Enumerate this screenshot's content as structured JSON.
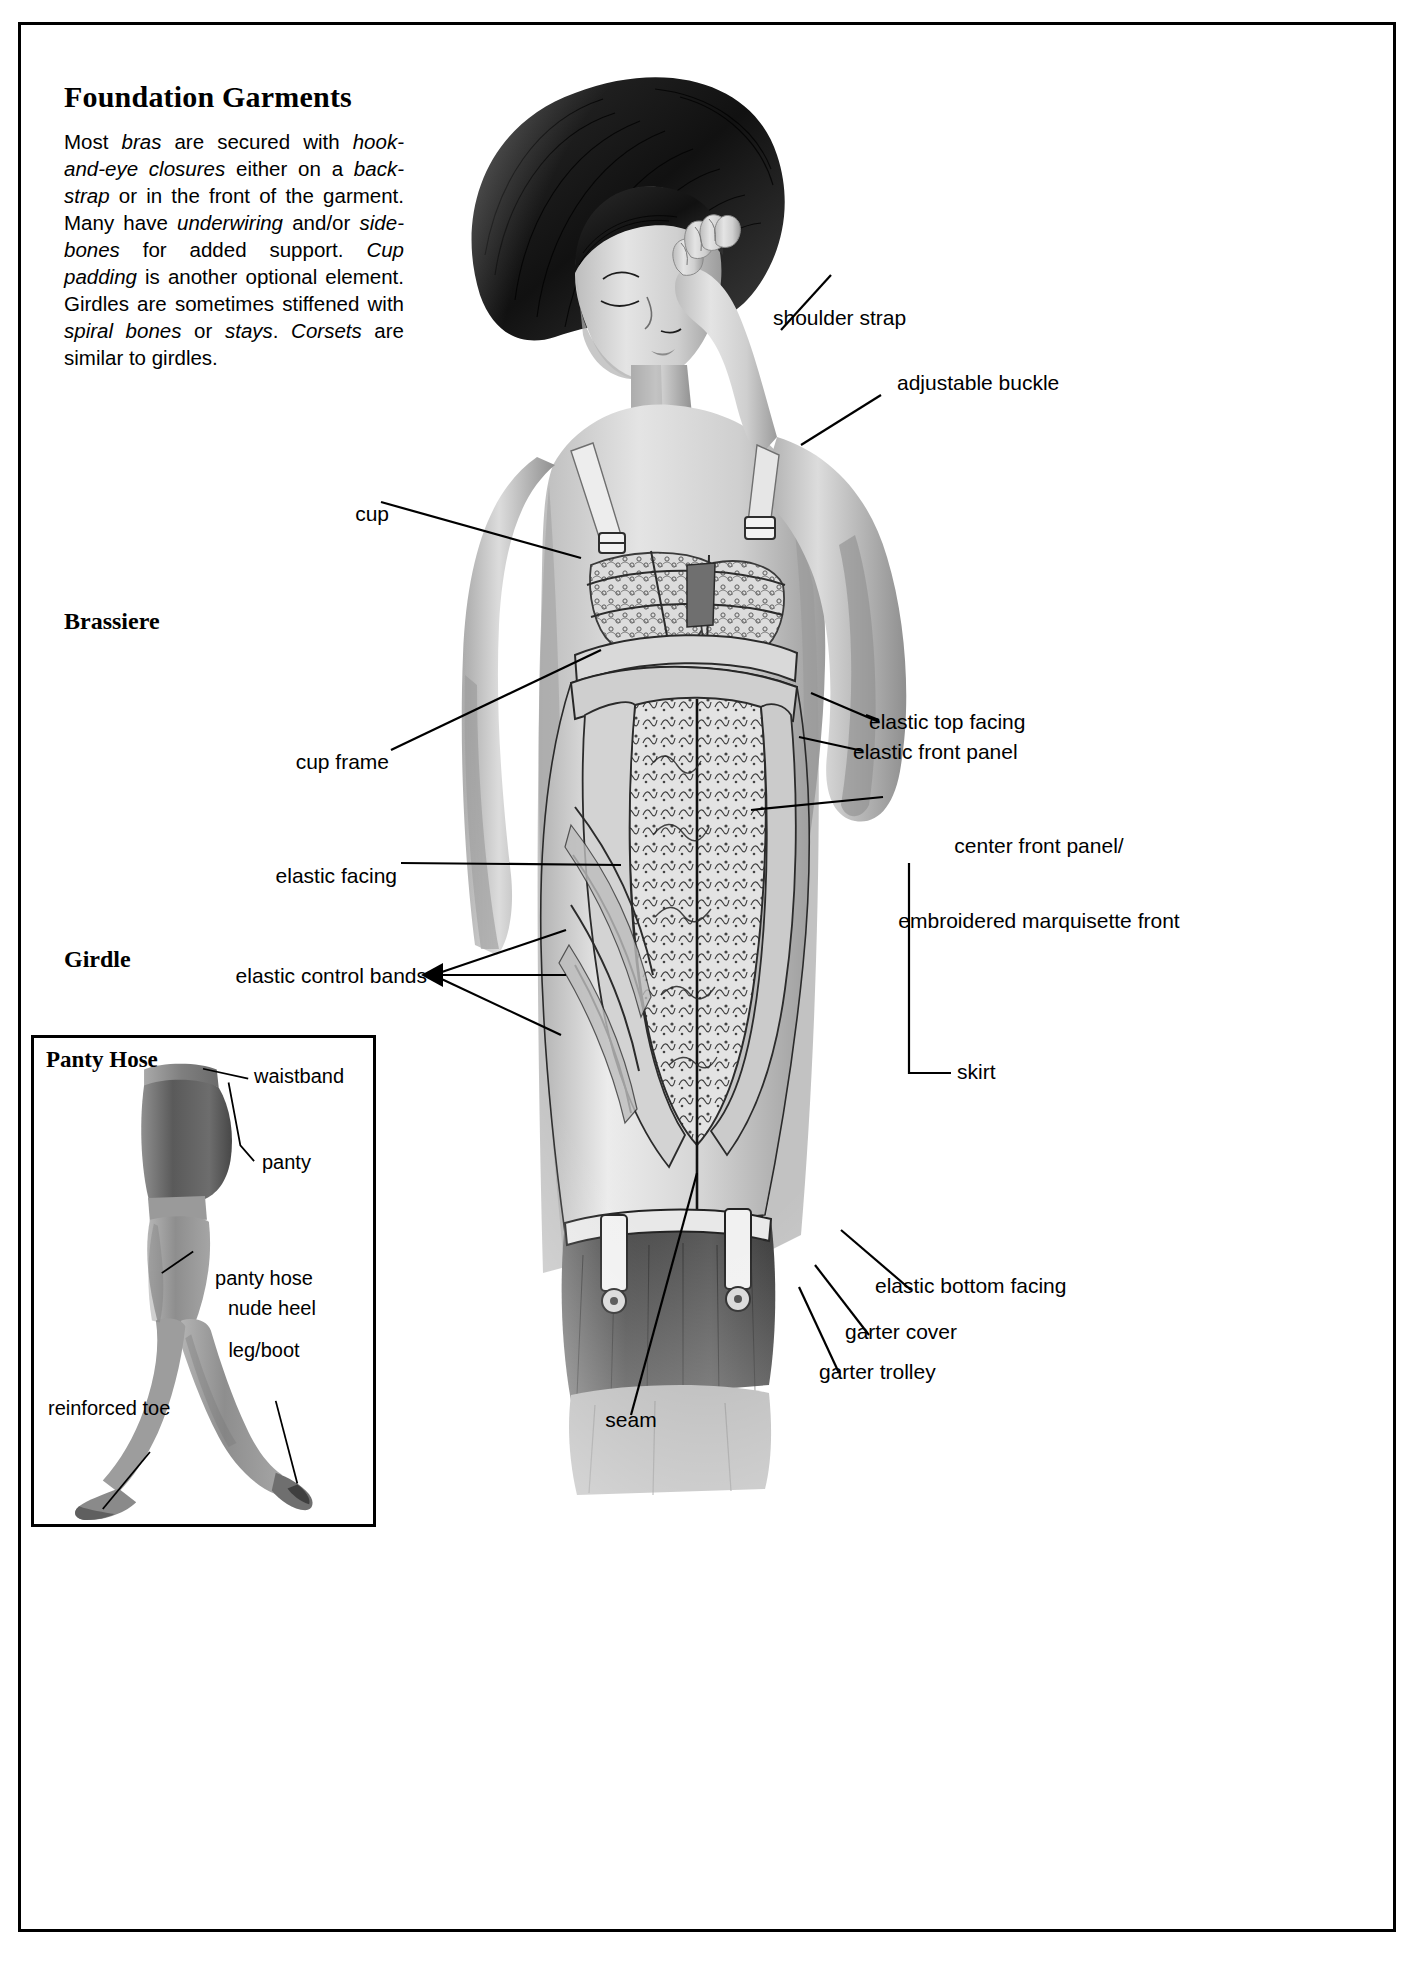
{
  "page": {
    "title": "Foundation Garments",
    "intro_paragraph": "Most bras are secured with hook-and-eye closures either on a back-strap or in the front of the garment. Many have underwiring and/or side-bones for added support. Cup padding is another optional element. Girdles are sometimes stiffened with spiral bones or stays. Corsets are similar to girdles.",
    "intro_runs": [
      {
        "text": "Most ",
        "italic": false
      },
      {
        "text": "bras",
        "italic": true
      },
      {
        "text": " are secured with ",
        "italic": false
      },
      {
        "text": "hook-and-eye closures",
        "italic": true
      },
      {
        "text": " either on a ",
        "italic": false
      },
      {
        "text": "back-strap",
        "italic": true
      },
      {
        "text": " or in the front of the garment. Many have ",
        "italic": false
      },
      {
        "text": "underwiring",
        "italic": true
      },
      {
        "text": " and/or ",
        "italic": false
      },
      {
        "text": "side-bones",
        "italic": true
      },
      {
        "text": " for added support. ",
        "italic": false
      },
      {
        "text": "Cup padding",
        "italic": true
      },
      {
        "text": " is another optional element. Girdles are sometimes stiffened with ",
        "italic": false
      },
      {
        "text": "spiral bones",
        "italic": true
      },
      {
        "text": " or ",
        "italic": false
      },
      {
        "text": "stays",
        "italic": true
      },
      {
        "text": ". ",
        "italic": false
      },
      {
        "text": "Corsets",
        "italic": true
      },
      {
        "text": " are similar to girdles.",
        "italic": false
      }
    ]
  },
  "sections": {
    "brassiere": "Brassiere",
    "girdle": "Girdle"
  },
  "callouts": {
    "shoulder_strap": "shoulder strap",
    "adjustable_buckle": "adjustable buckle",
    "cup": "cup",
    "cup_frame": "cup frame",
    "elastic_facing": "elastic facing",
    "elastic_control_bands": "elastic control bands",
    "elastic_top_facing": "elastic top facing",
    "elastic_front_panel": "elastic front panel",
    "center_front_panel_line1": "center front panel/",
    "center_front_panel_line2": "embroidered marquisette front",
    "skirt": "skirt",
    "elastic_bottom_facing": "elastic bottom facing",
    "garter_cover": "garter cover",
    "garter_trolley": "garter trolley",
    "seam": "seam"
  },
  "pantyhose": {
    "title": "Panty Hose",
    "labels": {
      "waistband": "waistband",
      "panty": "panty",
      "leg_boot_line1": "panty hose",
      "leg_boot_line2": "leg/boot",
      "nude_heel": "nude heel",
      "reinforced_toe": "reinforced toe"
    }
  },
  "colors": {
    "ink": "#000000",
    "paper": "#ffffff",
    "pencil_mid": "#8e8e8e",
    "pencil_dark": "#3a3a3a",
    "pencil_light": "#c9c9c9"
  }
}
